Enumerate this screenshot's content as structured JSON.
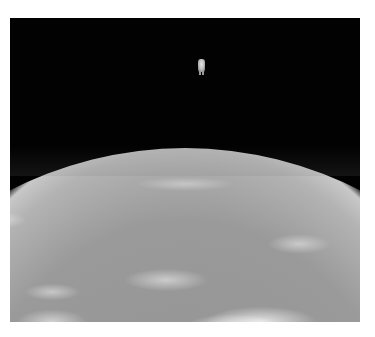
{
  "image": {
    "subject": "astronaut floating untethered above Earth",
    "style": "grayscale photograph",
    "colors": {
      "page_background": "#ffffff",
      "space": "#020202",
      "earth_base": "#9a9a9a",
      "clouds": "#f0f0f0",
      "horizon_glow": "#c8c8c8"
    },
    "regions": [
      {
        "name": "black space sky",
        "position": "top"
      },
      {
        "name": "astronaut",
        "position": "top center"
      },
      {
        "name": "curved Earth horizon",
        "position": "middle"
      },
      {
        "name": "cloud-covered Earth surface",
        "position": "bottom half"
      }
    ]
  }
}
